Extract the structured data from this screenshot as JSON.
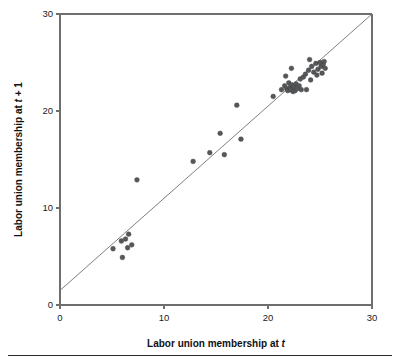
{
  "figure": {
    "background_color": "#ffffff",
    "point_color": "#555759",
    "axis_color": "#6e6e6e",
    "line_color": "#707070",
    "footer_rule_color": "#2b2b2b"
  },
  "chart_data": {
    "type": "scatter",
    "title": "",
    "subtitle": "",
    "xlabel_parts": {
      "prefix": "Labor union membership at ",
      "italic": "t",
      "suffix": ""
    },
    "ylabel_parts": {
      "prefix": "Labor union membership at ",
      "italic": "t",
      "suffix": " + 1"
    },
    "xlabel": "Labor union membership at t",
    "ylabel": "Labor union membership at t + 1",
    "xlim": [
      0,
      30
    ],
    "ylim": [
      0,
      30
    ],
    "xticks": [
      0,
      10,
      20,
      30
    ],
    "yticks": [
      0,
      10,
      20,
      30
    ],
    "xticklabels": [
      "0",
      "10",
      "20",
      "30"
    ],
    "yticklabels": [
      "0",
      "10",
      "20",
      "30"
    ],
    "grid": false,
    "legend": false,
    "legend_position": "none",
    "marker": "circle",
    "marker_size_px": 4.4,
    "annotations": [
      {
        "name": "reference-line",
        "type": "line",
        "description": "45-degree-like regression reference line",
        "x0": 0.0,
        "y0": 1.5,
        "x1": 30.0,
        "y1": 30.0
      }
    ],
    "series": [
      {
        "name": "Labor union membership pairs",
        "points": [
          [
            5.1,
            5.8
          ],
          [
            5.9,
            6.6
          ],
          [
            6.0,
            4.9
          ],
          [
            6.3,
            6.8
          ],
          [
            6.5,
            5.9
          ],
          [
            6.6,
            7.3
          ],
          [
            6.9,
            6.2
          ],
          [
            7.4,
            12.9
          ],
          [
            12.8,
            14.8
          ],
          [
            14.4,
            15.7
          ],
          [
            15.4,
            17.7
          ],
          [
            15.8,
            15.5
          ],
          [
            17.0,
            20.6
          ],
          [
            17.4,
            17.1
          ],
          [
            20.5,
            21.5
          ],
          [
            21.3,
            22.2
          ],
          [
            21.6,
            22.6
          ],
          [
            21.7,
            23.6
          ],
          [
            21.8,
            22.3
          ],
          [
            21.9,
            22.1
          ],
          [
            22.0,
            22.9
          ],
          [
            22.1,
            22.4
          ],
          [
            22.2,
            22.2
          ],
          [
            22.25,
            24.4
          ],
          [
            22.3,
            22.7
          ],
          [
            22.4,
            22.0
          ],
          [
            22.5,
            22.5
          ],
          [
            22.6,
            22.1
          ],
          [
            22.7,
            22.8
          ],
          [
            22.8,
            22.3
          ],
          [
            23.0,
            22.6
          ],
          [
            23.1,
            23.3
          ],
          [
            23.2,
            22.2
          ],
          [
            23.4,
            23.5
          ],
          [
            23.6,
            23.8
          ],
          [
            23.7,
            22.2
          ],
          [
            23.9,
            24.2
          ],
          [
            24.0,
            25.3
          ],
          [
            24.1,
            23.2
          ],
          [
            24.2,
            24.6
          ],
          [
            24.4,
            24.0
          ],
          [
            24.6,
            24.9
          ],
          [
            24.7,
            23.7
          ],
          [
            24.8,
            24.3
          ],
          [
            25.0,
            25.0
          ],
          [
            25.1,
            24.6
          ],
          [
            25.2,
            23.9
          ],
          [
            25.3,
            24.8
          ],
          [
            25.4,
            25.1
          ],
          [
            25.5,
            24.4
          ]
        ]
      }
    ]
  }
}
